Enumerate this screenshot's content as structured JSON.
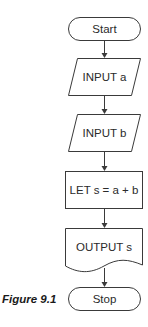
{
  "diagram": {
    "type": "flowchart",
    "caption": "Figure 9.1",
    "nodes": [
      {
        "id": "start",
        "shape": "terminator",
        "label": "Start"
      },
      {
        "id": "input_a",
        "shape": "parallelogram",
        "label": "INPUT a"
      },
      {
        "id": "input_b",
        "shape": "parallelogram",
        "label": "INPUT b"
      },
      {
        "id": "process",
        "shape": "rectangle",
        "label": "LET s = a + b"
      },
      {
        "id": "output",
        "shape": "document",
        "label": "OUTPUT s"
      },
      {
        "id": "stop",
        "shape": "terminator",
        "label": "Stop"
      }
    ],
    "edges": [
      {
        "from": "start",
        "to": "input_a"
      },
      {
        "from": "input_a",
        "to": "input_b"
      },
      {
        "from": "input_b",
        "to": "process"
      },
      {
        "from": "process",
        "to": "output"
      },
      {
        "from": "output",
        "to": "stop"
      }
    ],
    "colors": {
      "stroke": "#3a3a3a",
      "fill": "#ffffff",
      "text": "#2a2a2a"
    }
  }
}
